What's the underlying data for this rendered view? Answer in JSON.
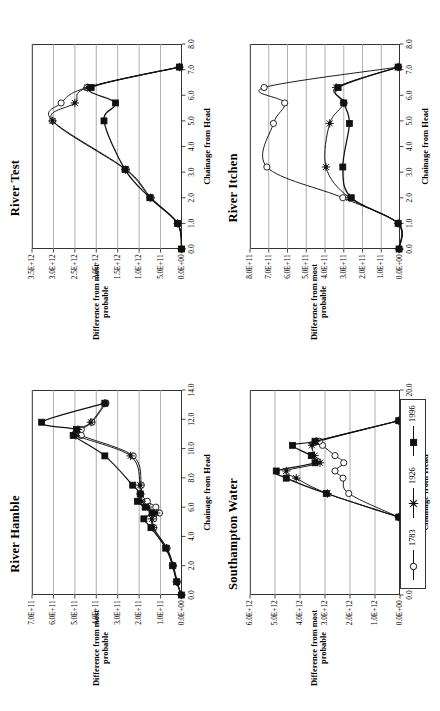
{
  "figure": {
    "rotation": "90deg counter-clockwise",
    "axis_title_y": "Difference from most probable",
    "axis_title_y_line1": "Difference from most",
    "axis_title_y_line2": "probable",
    "axis_title_x": "Chainage from Head"
  },
  "legend": {
    "entries": [
      {
        "label": "1783",
        "marker": "open-circle",
        "color": "#111111"
      },
      {
        "label": "1926",
        "marker": "star-asterisk",
        "color": "#111111"
      },
      {
        "label": "1996",
        "marker": "filled-square",
        "color": "#111111"
      }
    ]
  },
  "chart_data": [
    {
      "type": "line",
      "title": "River Hamble",
      "xlabel": "Chainage from Head",
      "ylabel": "Difference from most probable",
      "xlim": [
        0.0,
        14.0
      ],
      "ylim": [
        0,
        700000000000
      ],
      "xticks": [
        "0.0",
        "2.0",
        "4.0",
        "6.0",
        "8.0",
        "10.0",
        "12.0",
        "14.0"
      ],
      "xtick_values": [
        0,
        2,
        4,
        6,
        8,
        10,
        12,
        14
      ],
      "yticks": [
        "0.0E+00",
        "1.0E+11",
        "2.0E+11",
        "3.0E+11",
        "4.0E+11",
        "5.0E+11",
        "6.0E+11",
        "7.0E+11"
      ],
      "ytick_values": [
        0,
        100000000000,
        200000000000,
        300000000000,
        400000000000,
        500000000000,
        600000000000,
        700000000000
      ],
      "grid": true,
      "legend_position": "external-right",
      "series": [
        {
          "name": "1783",
          "marker": "open-circle",
          "x": [
            0.0,
            0.9,
            2.0,
            3.2,
            4.6,
            5.2,
            5.6,
            6.0,
            6.4,
            6.9,
            7.5,
            9.5,
            10.9,
            11.3,
            11.8,
            13.1
          ],
          "values": [
            3000000000.0,
            22000000000.0,
            40000000000.0,
            70000000000.0,
            132000000000.0,
            132000000000.0,
            105000000000.0,
            122000000000.0,
            162000000000.0,
            192000000000.0,
            190000000000.0,
            228000000000.0,
            470000000000.0,
            470000000000.0,
            420000000000.0,
            355000000000.0
          ]
        },
        {
          "name": "1926",
          "marker": "star-asterisk",
          "x": [
            0.0,
            0.9,
            2.0,
            3.2,
            4.6,
            5.2,
            5.6,
            6.0,
            6.4,
            6.9,
            7.5,
            9.5,
            10.9,
            11.3,
            11.8,
            13.1
          ],
          "values": [
            3000000000.0,
            25000000000.0,
            42000000000.0,
            72000000000.0,
            135000000000.0,
            140000000000.0,
            120000000000.0,
            158000000000.0,
            188000000000.0,
            195000000000.0,
            195000000000.0,
            240000000000.0,
            495000000000.0,
            485000000000.0,
            425000000000.0,
            360000000000.0
          ]
        },
        {
          "name": "1996",
          "marker": "filled-square",
          "x": [
            0.0,
            0.9,
            2.0,
            3.2,
            4.6,
            5.2,
            5.6,
            6.0,
            6.4,
            6.9,
            7.5,
            9.5,
            10.9,
            11.3,
            11.8,
            13.1
          ],
          "values": [
            3000000000.0,
            25000000000.0,
            44000000000.0,
            76000000000.0,
            145000000000.0,
            178000000000.0,
            140000000000.0,
            172000000000.0,
            208000000000.0,
            195000000000.0,
            230000000000.0,
            360000000000.0,
            508000000000.0,
            492000000000.0,
            655000000000.0,
            360000000000.0
          ]
        }
      ]
    },
    {
      "type": "line",
      "title": "Southampton Water",
      "xlabel": "Chainage from Head",
      "ylabel": "Difference from most probable",
      "xlim": [
        0.0,
        20.0
      ],
      "ylim": [
        0,
        6000000000000
      ],
      "xticks": [
        "0.0",
        "5.0",
        "10.0",
        "15.0",
        "20.0"
      ],
      "xtick_values": [
        0,
        5,
        10,
        15,
        20
      ],
      "yticks": [
        "0.0E+00",
        "1.0E+12",
        "2.0E+12",
        "3.0E+12",
        "4.0E+12",
        "5.0E+12",
        "6.0E+12"
      ],
      "ytick_values": [
        0,
        1000000000000,
        2000000000000,
        3000000000000,
        4000000000000,
        5000000000000,
        6000000000000
      ],
      "grid": true,
      "legend_position": "external-right",
      "series": [
        {
          "name": "1783",
          "marker": "open-circle",
          "x": [
            7.6,
            9.9,
            11.4,
            12.1,
            12.9,
            13.6,
            14.6,
            15.0,
            17.0
          ],
          "values": [
            50000000000.0,
            2050000000000.0,
            2280000000000.0,
            2600000000000.0,
            2250000000000.0,
            2600000000000.0,
            3100000000000.0,
            3220000000000.0,
            50000000000.0
          ]
        },
        {
          "name": "1926",
          "marker": "star-asterisk",
          "x": [
            7.6,
            9.9,
            11.4,
            12.1,
            12.9,
            13.6,
            14.6,
            15.0,
            17.0
          ],
          "values": [
            50000000000.0,
            2900000000000.0,
            4150000000000.0,
            4550000000000.0,
            3200000000000.0,
            3420000000000.0,
            3520000000000.0,
            3350000000000.0,
            50000000000.0
          ]
        },
        {
          "name": "1996",
          "marker": "filled-square",
          "x": [
            7.6,
            9.9,
            11.4,
            12.1,
            12.9,
            13.6,
            14.6,
            15.0,
            17.0
          ],
          "values": [
            50000000000.0,
            2950000000000.0,
            4550000000000.0,
            4950000000000.0,
            3400000000000.0,
            3550000000000.0,
            4300000000000.0,
            3400000000000.0,
            50000000000.0
          ]
        }
      ]
    },
    {
      "type": "line",
      "title": "River Test",
      "xlabel": "Chainage from Head",
      "ylabel": "Difference from most probable",
      "xlim": [
        0.0,
        8.0
      ],
      "ylim": [
        0,
        3500000000000
      ],
      "xticks": [
        "0.0",
        "1.0",
        "2.0",
        "3.0",
        "4.0",
        "5.0",
        "6.0",
        "7.0",
        "8.0"
      ],
      "xtick_values": [
        0,
        1,
        2,
        3,
        4,
        5,
        6,
        7,
        8
      ],
      "yticks": [
        "0.0E+00",
        "5.0E+11",
        "1.0E+12",
        "1.5E+12",
        "2.0E+12",
        "2.5E+12",
        "3.0E+12",
        "3.5E+12"
      ],
      "ytick_values": [
        0,
        500000000000,
        1000000000000,
        1500000000000,
        2000000000000,
        2500000000000,
        3000000000000,
        3500000000000
      ],
      "grid": true,
      "legend_position": "external-right",
      "series": [
        {
          "name": "1783",
          "marker": "open-circle",
          "x": [
            0.0,
            1.0,
            2.0,
            3.1,
            5.0,
            5.7,
            6.3,
            7.1
          ],
          "values": [
            10000000000.0,
            100000000000.0,
            720000000000.0,
            1300000000000.0,
            3020000000000.0,
            2820000000000.0,
            2220000000000.0,
            60000000000.0
          ]
        },
        {
          "name": "1926",
          "marker": "star-asterisk",
          "x": [
            0.0,
            1.0,
            2.0,
            3.1,
            5.0,
            5.7,
            6.3,
            7.1
          ],
          "values": [
            10000000000.0,
            102000000000.0,
            740000000000.0,
            1320000000000.0,
            3020000000000.0,
            2500000000000.0,
            2200000000000.0,
            60000000000.0
          ]
        },
        {
          "name": "1996",
          "marker": "filled-square",
          "x": [
            0.0,
            1.0,
            2.0,
            3.1,
            5.0,
            5.7,
            6.3,
            7.1
          ],
          "values": [
            10000000000.0,
            105000000000.0,
            750000000000.0,
            1330000000000.0,
            1820000000000.0,
            1550000000000.0,
            2120000000000.0,
            60000000000.0
          ]
        }
      ]
    },
    {
      "type": "line",
      "title": "River Itchen",
      "xlabel": "Chainage from Head",
      "ylabel": "Difference from most probable",
      "xlim": [
        0.0,
        8.0
      ],
      "ylim": [
        0,
        800000000000
      ],
      "xticks": [
        "0.0",
        "1.0",
        "2.0",
        "3.0",
        "4.0",
        "5.0",
        "6.0",
        "7.0",
        "8.0"
      ],
      "xtick_values": [
        0,
        1,
        2,
        3,
        4,
        5,
        6,
        7,
        8
      ],
      "yticks": [
        "0.0E+00",
        "1.0E+11",
        "2.0E+11",
        "3.0E+11",
        "4.0E+11",
        "5.0E+11",
        "6.0E+11",
        "7.0E+11",
        "8.0E+11"
      ],
      "ytick_values": [
        0,
        100000000000,
        200000000000,
        300000000000,
        400000000000,
        500000000000,
        600000000000,
        700000000000,
        800000000000
      ],
      "grid": true,
      "legend_position": "external-right",
      "series": [
        {
          "name": "1783",
          "marker": "open-circle",
          "x": [
            0.0,
            1.0,
            2.0,
            3.2,
            4.9,
            5.7,
            6.3,
            7.1
          ],
          "values": [
            5000000000.0,
            10000000000.0,
            305000000000.0,
            710000000000.0,
            675000000000.0,
            615000000000.0,
            725000000000.0,
            10000000000.0
          ]
        },
        {
          "name": "1926",
          "marker": "star-asterisk",
          "x": [
            0.0,
            1.0,
            2.0,
            3.2,
            4.9,
            5.7,
            6.3,
            7.1
          ],
          "values": [
            5000000000.0,
            10000000000.0,
            270000000000.0,
            395000000000.0,
            375000000000.0,
            300000000000.0,
            340000000000.0,
            10000000000.0
          ]
        },
        {
          "name": "1996",
          "marker": "filled-square",
          "x": [
            0.0,
            1.0,
            2.0,
            3.2,
            4.9,
            5.7,
            6.3,
            7.1
          ],
          "values": [
            5000000000.0,
            10000000000.0,
            260000000000.0,
            305000000000.0,
            270000000000.0,
            300000000000.0,
            330000000000.0,
            10000000000.0
          ]
        }
      ]
    }
  ]
}
